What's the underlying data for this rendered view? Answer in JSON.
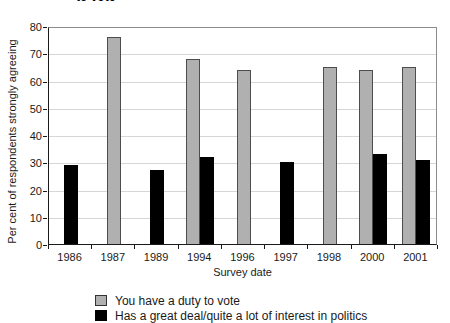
{
  "figure": {
    "cropped_title_fragment": "to vote"
  },
  "colors": {
    "duty_fill": "#b0b0b0",
    "duty_border": "#4d4d4d",
    "interest_fill": "#000000",
    "interest_border": "#000000",
    "gridline": "#d6d6d6",
    "axis": "#1a1a1a",
    "frame": "#8c8c8c"
  },
  "chart_data": {
    "type": "bar",
    "title": "",
    "xlabel": "Survey date",
    "ylabel": "Per cent of respondents strongly agreeing",
    "ylim": [
      0,
      80
    ],
    "ytick_step": 10,
    "yticks": [
      0,
      10,
      20,
      30,
      40,
      50,
      60,
      70,
      80
    ],
    "grid": "horizontal gridlines on",
    "legend_position": "bottom-left",
    "categories": [
      "1986",
      "1987",
      "1989",
      "1994",
      "1996",
      "1997",
      "1998",
      "2000",
      "2001"
    ],
    "series": [
      {
        "name": "You have a duty to vote",
        "key": "duty-to-vote",
        "color": "#b0b0b0",
        "values": [
          null,
          76,
          null,
          68,
          64,
          null,
          65,
          64,
          65
        ]
      },
      {
        "name": "Has a great deal/quite a lot of interest in politics",
        "key": "interest-in-politics",
        "color": "#000000",
        "values": [
          29,
          null,
          27,
          32,
          null,
          30,
          null,
          33,
          31
        ]
      }
    ]
  }
}
